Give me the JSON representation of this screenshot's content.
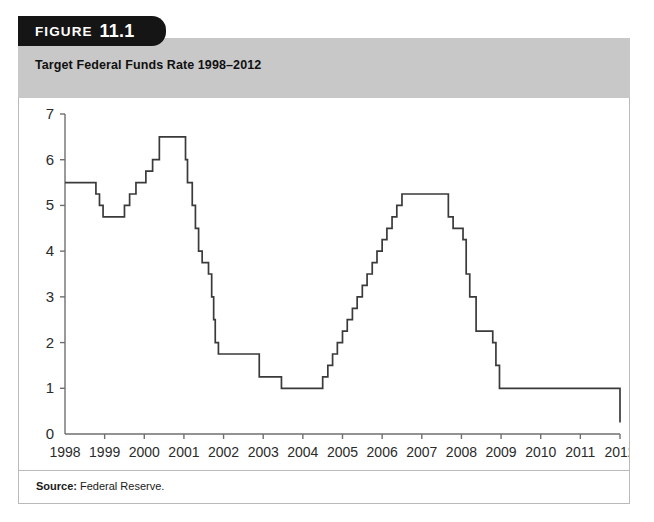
{
  "figure": {
    "tab_word": "FIGURE",
    "tab_number": "11.1",
    "title": "Target Federal Funds Rate 1998–2012"
  },
  "source": {
    "label": "Source:",
    "value": "Federal Reserve."
  },
  "colors": {
    "tab_background": "#151515",
    "title_band": "#c8c8c8",
    "panel_border": "#b9b9b9",
    "line": "#3a3a3a",
    "axis": "#6f6f6f",
    "text": "#2b2b2b"
  },
  "chart_data": {
    "type": "line",
    "step": "post",
    "title": "Target Federal Funds Rate 1998–2012",
    "xlabel": "",
    "ylabel": "",
    "xlim": [
      1998,
      2012
    ],
    "ylim": [
      0,
      7
    ],
    "yticks": [
      0,
      1,
      2,
      3,
      4,
      5,
      6,
      7
    ],
    "ytick_labels": [
      "0",
      "1",
      "2",
      "3",
      "4",
      "5",
      "6",
      "7"
    ],
    "xticks": [
      1998,
      1999,
      2000,
      2001,
      2002,
      2003,
      2004,
      2005,
      2006,
      2007,
      2008,
      2009,
      2010,
      2011,
      2012
    ],
    "xtick_labels": [
      "1998",
      "1999",
      "2000",
      "2001",
      "2002",
      "2003",
      "2004",
      "2005",
      "2006",
      "2007",
      "2008",
      "2009",
      "2010",
      "2011",
      "2012"
    ],
    "grid": false,
    "legend": null,
    "series": [
      {
        "name": "Target Federal Funds Rate",
        "units": "percent",
        "x": [
          1998.0,
          1998.78,
          1998.87,
          1998.96,
          1999.5,
          1999.63,
          1999.79,
          2000.04,
          2000.21,
          2000.38,
          2000.46,
          2001.04,
          2001.09,
          2001.21,
          2001.29,
          2001.37,
          2001.46,
          2001.62,
          2001.7,
          2001.75,
          2001.79,
          2001.87,
          2002.9,
          2003.46,
          2004.5,
          2004.63,
          2004.75,
          2004.87,
          2005.0,
          2005.12,
          2005.25,
          2005.37,
          2005.5,
          2005.62,
          2005.75,
          2005.87,
          2006.0,
          2006.12,
          2006.25,
          2006.37,
          2006.5,
          2007.67,
          2007.79,
          2008.04,
          2008.12,
          2008.21,
          2008.37,
          2008.79,
          2008.87,
          2008.96,
          2012.0
        ],
        "y": [
          5.5,
          5.25,
          5.0,
          4.75,
          5.0,
          5.25,
          5.5,
          5.75,
          6.0,
          6.5,
          6.5,
          6.0,
          5.5,
          5.0,
          4.5,
          4.0,
          3.75,
          3.5,
          3.0,
          2.5,
          2.0,
          1.75,
          1.25,
          1.0,
          1.25,
          1.5,
          1.75,
          2.0,
          2.25,
          2.5,
          2.75,
          3.0,
          3.25,
          3.5,
          3.75,
          4.0,
          4.25,
          4.5,
          4.75,
          5.0,
          5.25,
          4.75,
          4.5,
          4.25,
          3.5,
          3.0,
          2.25,
          2.0,
          1.5,
          1.0,
          0.25
        ]
      }
    ],
    "annotations": []
  }
}
